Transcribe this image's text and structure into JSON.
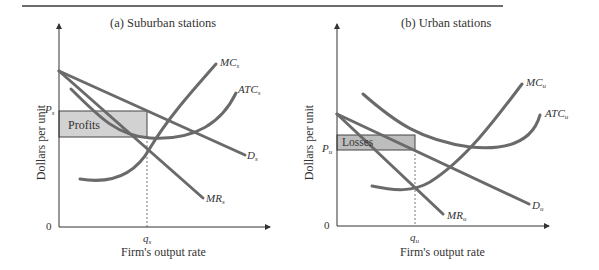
{
  "panels": [
    {
      "title": "(a) Suburban stations",
      "ylabel": "Dollars per unit",
      "xlabel": "Firm's output rate",
      "origin": "0",
      "price_label": "P",
      "price_sub": "s",
      "qty_label": "q",
      "qty_sub": "s",
      "area_label": "Profits",
      "curves": {
        "mc": {
          "label": "MC",
          "sub": "s"
        },
        "atc": {
          "label": "ATC",
          "sub": "s"
        },
        "d": {
          "label": "D",
          "sub": "s"
        },
        "mr": {
          "label": "MR",
          "sub": "s"
        }
      }
    },
    {
      "title": "(b) Urban stations",
      "ylabel": "Dollars per unit",
      "xlabel": "Firm's output rate",
      "origin": "0",
      "price_label": "P",
      "price_sub": "u",
      "qty_label": "q",
      "qty_sub": "u",
      "area_label": "Losses",
      "curves": {
        "mc": {
          "label": "MC",
          "sub": "u"
        },
        "atc": {
          "label": "ATC",
          "sub": "u"
        },
        "d": {
          "label": "D",
          "sub": "u"
        },
        "mr": {
          "label": "MR",
          "sub": "u"
        }
      }
    }
  ],
  "colors": {
    "curve": "#6a6a6a",
    "axis": "#333333",
    "shade": "#cfcfcf",
    "rule": "#6d6d6d"
  }
}
